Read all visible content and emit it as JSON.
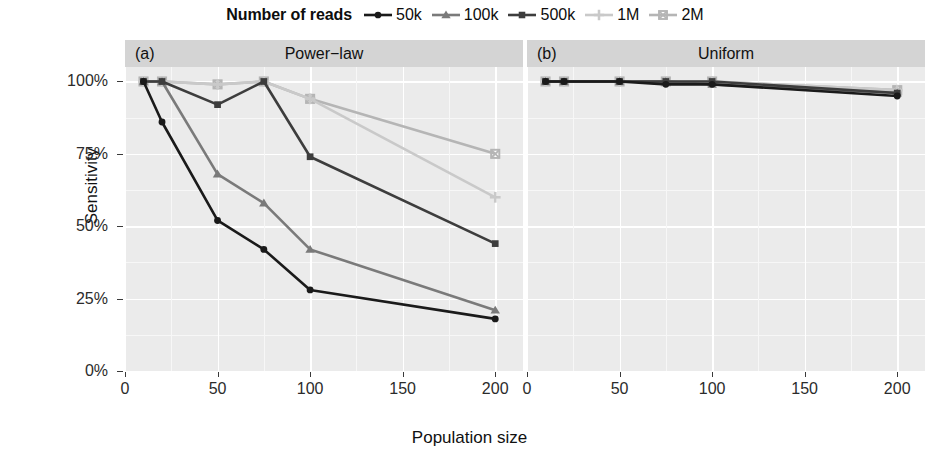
{
  "legend": {
    "title": "Number of reads",
    "items": [
      {
        "label": "50k",
        "key": "circle-marker",
        "color": "#1a1a1a"
      },
      {
        "label": "100k",
        "key": "triangle-marker",
        "color": "#7a7a7a"
      },
      {
        "label": "500k",
        "key": "square-marker",
        "color": "#3d3d3d"
      },
      {
        "label": "1M",
        "key": "plus-marker",
        "color": "#c9c9c9"
      },
      {
        "label": "2M",
        "key": "crossed-square-marker",
        "color": "#b5b5b5"
      }
    ]
  },
  "axes": {
    "y_title": "Sensitivity",
    "x_title": "Population size",
    "y_ticks": [
      "0%",
      "25%",
      "50%",
      "75%",
      "100%"
    ],
    "x_ticks": [
      "0",
      "50",
      "100",
      "150",
      "200"
    ]
  },
  "panels": [
    {
      "tag": "(a)",
      "title": "Power−law"
    },
    {
      "tag": "(b)",
      "title": "Uniform"
    }
  ],
  "chart_data": {
    "type": "line",
    "title": "",
    "subtitle": "",
    "xlabel": "Population size",
    "ylabel": "Sensitivity",
    "xlim": [
      0,
      215
    ],
    "ylim": [
      0,
      105
    ],
    "ytick_values": [
      0,
      25,
      50,
      75,
      100
    ],
    "xtick_values": [
      0,
      50,
      100,
      150,
      200
    ],
    "grid": true,
    "legend_position": "top",
    "legend_title": "Number of reads",
    "x": [
      10,
      20,
      50,
      75,
      100,
      200
    ],
    "panels": [
      {
        "tag": "(a)",
        "name": "Power-law",
        "series": [
          {
            "name": "50k",
            "marker": "circle",
            "color": "#1a1a1a",
            "values": [
              100,
              86,
              52,
              42,
              28,
              18
            ]
          },
          {
            "name": "100k",
            "marker": "triangle",
            "color": "#7a7a7a",
            "values": [
              100,
              100,
              68,
              58,
              42,
              21
            ]
          },
          {
            "name": "500k",
            "marker": "square",
            "color": "#3d3d3d",
            "values": [
              100,
              100,
              92,
              100,
              74,
              44
            ]
          },
          {
            "name": "1M",
            "marker": "plus",
            "color": "#c9c9c9",
            "values": [
              100,
              100,
              99,
              100,
              94,
              60
            ]
          },
          {
            "name": "2M",
            "marker": "crossed-square",
            "color": "#b5b5b5",
            "values": [
              100,
              100,
              99,
              100,
              94,
              75
            ]
          }
        ]
      },
      {
        "tag": "(b)",
        "name": "Uniform",
        "series": [
          {
            "name": "50k",
            "marker": "circle",
            "color": "#1a1a1a",
            "values": [
              100,
              100,
              100,
              99,
              99,
              95
            ]
          },
          {
            "name": "100k",
            "marker": "triangle",
            "color": "#7a7a7a",
            "values": [
              100,
              100,
              100,
              100,
              99,
              96
            ]
          },
          {
            "name": "500k",
            "marker": "square",
            "color": "#3d3d3d",
            "values": [
              100,
              100,
              100,
              100,
              100,
              96
            ]
          },
          {
            "name": "1M",
            "marker": "plus",
            "color": "#c9c9c9",
            "values": [
              100,
              100,
              100,
              100,
              100,
              97
            ]
          },
          {
            "name": "2M",
            "marker": "crossed-square",
            "color": "#b5b5b5",
            "values": [
              100,
              100,
              100,
              100,
              100,
              97
            ]
          }
        ]
      }
    ]
  }
}
